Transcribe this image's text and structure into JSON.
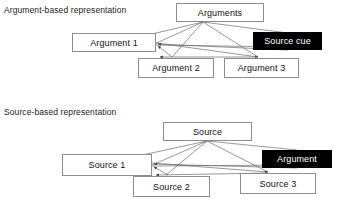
{
  "figure": {
    "type": "node-link-diagram",
    "width": 346,
    "height": 213,
    "background_color": "#ffffff",
    "box_border_color": "#8d8d8d",
    "link_color": "#6b6b6b",
    "highlight_fill": "#000000",
    "highlight_text": "#ffffff"
  },
  "panels": [
    {
      "id": "argument-based",
      "caption": "Argument-based representation",
      "caption_pos": {
        "x": 4,
        "y": 5
      },
      "nodes": [
        {
          "id": "hub",
          "label": "Arguments",
          "x": 176,
          "y": 3,
          "w": 88,
          "h": 19,
          "style": "plain"
        },
        {
          "id": "n1",
          "label": "Argument 1",
          "x": 72,
          "y": 33,
          "w": 84,
          "h": 19,
          "style": "plain"
        },
        {
          "id": "n2",
          "label": "Argument  2",
          "x": 138,
          "y": 58,
          "w": 76,
          "h": 20,
          "style": "plain"
        },
        {
          "id": "n3",
          "label": "Argument 3",
          "x": 224,
          "y": 58,
          "w": 75,
          "h": 20,
          "style": "plain"
        },
        {
          "id": "cue",
          "label": "Source cue",
          "x": 253,
          "y": 32,
          "w": 69,
          "h": 18,
          "style": "highlight"
        }
      ],
      "edges": [
        {
          "from": "hub",
          "to": "n1"
        },
        {
          "from": "hub",
          "to": "n2"
        },
        {
          "from": "hub",
          "to": "n3"
        },
        {
          "from": "hub",
          "to": "cue"
        },
        {
          "from": "n1",
          "to": "n2"
        },
        {
          "from": "n1",
          "to": "n3"
        },
        {
          "from": "n1",
          "to": "cue"
        },
        {
          "from": "n2",
          "to": "n3"
        },
        {
          "from": "n3",
          "to": "n1"
        },
        {
          "from": "cue",
          "to": "n1"
        }
      ]
    },
    {
      "id": "source-based",
      "caption": "Source-based representation",
      "caption_pos": {
        "x": 4,
        "y": 107
      },
      "nodes": [
        {
          "id": "hub",
          "label": "Source",
          "x": 163,
          "y": 122,
          "w": 89,
          "h": 19,
          "style": "plain"
        },
        {
          "id": "n1",
          "label": "Source 1",
          "x": 62,
          "y": 154,
          "w": 90,
          "h": 22,
          "style": "plain"
        },
        {
          "id": "n2",
          "label": "Source 2",
          "x": 133,
          "y": 176,
          "w": 77,
          "h": 21,
          "style": "plain"
        },
        {
          "id": "n3",
          "label": "Source 3",
          "x": 240,
          "y": 173,
          "w": 76,
          "h": 21,
          "style": "plain"
        },
        {
          "id": "cue",
          "label": "Argument",
          "x": 262,
          "y": 150,
          "w": 70,
          "h": 18,
          "style": "highlight"
        }
      ],
      "edges": [
        {
          "from": "hub",
          "to": "n1"
        },
        {
          "from": "hub",
          "to": "n2"
        },
        {
          "from": "hub",
          "to": "n3"
        },
        {
          "from": "hub",
          "to": "cue"
        },
        {
          "from": "n1",
          "to": "n2"
        },
        {
          "from": "n1",
          "to": "n3"
        },
        {
          "from": "n1",
          "to": "cue"
        },
        {
          "from": "n2",
          "to": "n3"
        },
        {
          "from": "n3",
          "to": "n1"
        },
        {
          "from": "cue",
          "to": "n1"
        }
      ]
    }
  ]
}
